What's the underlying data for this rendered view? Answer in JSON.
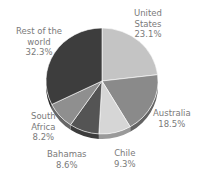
{
  "chart_data": {
    "type": "pie",
    "title": "",
    "start_angle_deg": 0,
    "direction": "clockwise",
    "style": "3d-tilted",
    "slices": [
      {
        "label": "United States",
        "value": 23.1,
        "display": "23.1%",
        "color": "#c4c4c4"
      },
      {
        "label": "Australia",
        "value": 18.5,
        "display": "18.5%",
        "color": "#8a8a8a"
      },
      {
        "label": "Chile",
        "value": 9.3,
        "display": "9.3%",
        "color": "#d6d6d6"
      },
      {
        "label": "Bahamas",
        "value": 8.6,
        "display": "8.6%",
        "color": "#545454"
      },
      {
        "label": "South Africa",
        "value": 8.2,
        "display": "8.2%",
        "color": "#8f8f8f"
      },
      {
        "label": "Rest of the world",
        "value": 32.3,
        "display": "32.3%",
        "color": "#3d3d3d"
      }
    ],
    "legend": "none (labels placed next to slices)"
  },
  "labels": {
    "united_states": {
      "line1": "United",
      "line2": "States",
      "pct": "23.1%"
    },
    "australia": {
      "line1": "Australia",
      "pct": "18.5%"
    },
    "chile": {
      "line1": "Chile",
      "pct": "9.3%"
    },
    "bahamas": {
      "line1": "Bahamas",
      "pct": "8.6%"
    },
    "south_africa": {
      "line1": "South",
      "line2": "Africa",
      "pct": "8.2%"
    },
    "rest_of_world": {
      "line1": "Rest of the",
      "line2": "world",
      "pct": "32.3%"
    }
  }
}
